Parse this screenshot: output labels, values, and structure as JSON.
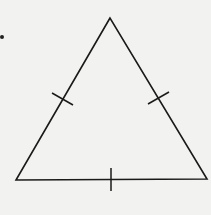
{
  "diagram": {
    "type": "equilateral-triangle",
    "stroke_color": "#1a1a1a",
    "background_color": "#f2f2f0",
    "vertices": {
      "apex": [
        110,
        18
      ],
      "bottom_left": [
        16,
        180
      ],
      "bottom_right": [
        207,
        179
      ]
    },
    "tick_marks": [
      {
        "side": "left",
        "from": [
          52,
          93
        ],
        "to": [
          73,
          105
        ]
      },
      {
        "side": "right",
        "from": [
          148,
          104
        ],
        "to": [
          169,
          92
        ]
      },
      {
        "side": "base",
        "from": [
          111,
          168
        ],
        "to": [
          111,
          191
        ]
      }
    ],
    "stray_dot": [
      2,
      37
    ]
  }
}
